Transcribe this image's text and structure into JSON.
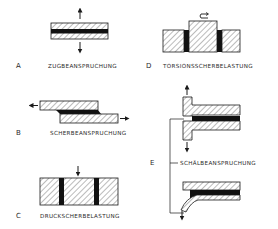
{
  "diagram": {
    "colors": {
      "ink": "#1a1a1a",
      "hatch": "#555555",
      "background": "#ffffff"
    },
    "panels": [
      {
        "id": "A",
        "letter": "A",
        "caption": "ZUGBEANSPRUCHUNG"
      },
      {
        "id": "B",
        "letter": "B",
        "caption": "SCHERBEANSPRUCHUNG"
      },
      {
        "id": "C",
        "letter": "C",
        "caption": "DRUCKSCHERBELASTUNG"
      },
      {
        "id": "D",
        "letter": "D",
        "caption": "TORSIONSSCHERBELASTUNG"
      },
      {
        "id": "E",
        "letter": "E",
        "caption": "SCHÄLBEANSPRUCHUNG"
      }
    ]
  }
}
